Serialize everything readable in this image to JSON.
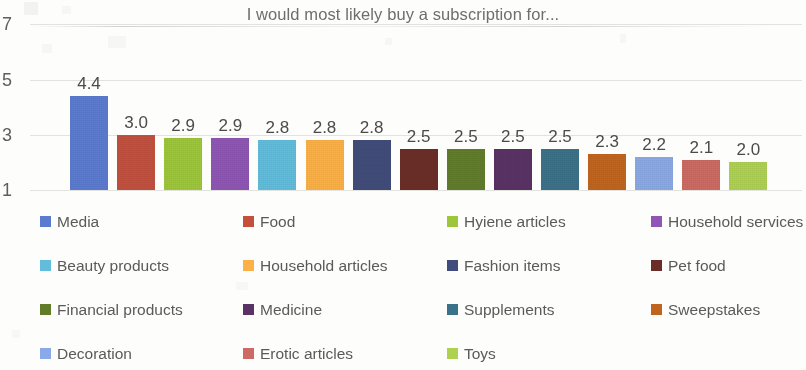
{
  "chart_data": {
    "type": "bar",
    "title": "I would most likely buy a subscription for...",
    "xlabel": "",
    "ylabel": "",
    "ylim": [
      1,
      7
    ],
    "yticks": [
      "1",
      "3",
      "5",
      "7"
    ],
    "grid": true,
    "legend_position": "bottom",
    "legend_columns": 4,
    "categories": [
      "Media",
      "Food",
      "Hyiene articles",
      "Household services",
      "Beauty products",
      "Household articles",
      "Fashion items",
      "Pet food",
      "Financial products",
      "Medicine",
      "Supplements",
      "Sweepstakes",
      "Decoration",
      "Erotic articles",
      "Toys"
    ],
    "values": [
      4.4,
      3.0,
      2.9,
      2.9,
      2.8,
      2.8,
      2.8,
      2.5,
      2.5,
      2.5,
      2.5,
      2.3,
      2.2,
      2.1,
      2.0
    ],
    "value_labels": [
      "4.4",
      "3.0",
      "2.9",
      "2.9",
      "2.8",
      "2.8",
      "2.8",
      "2.5",
      "2.5",
      "2.5",
      "2.5",
      "2.3",
      "2.2",
      "2.1",
      "2.0"
    ],
    "colors": [
      "#5b7bd0",
      "#c4503c",
      "#9ec63b",
      "#9055b5",
      "#62bddd",
      "#fcb147",
      "#424c7c",
      "#6b2d28",
      "#627d2a",
      "#5a3265",
      "#3a728a",
      "#c0651f",
      "#8aa9e8",
      "#cd6a63",
      "#aed24f"
    ]
  },
  "legend": {
    "items": [
      {
        "label": "Media",
        "color": "#5b7bd0"
      },
      {
        "label": "Food",
        "color": "#c4503c"
      },
      {
        "label": "Hyiene articles",
        "color": "#9ec63b"
      },
      {
        "label": "Household services",
        "color": "#9055b5"
      },
      {
        "label": "Beauty products",
        "color": "#62bddd"
      },
      {
        "label": "Household articles",
        "color": "#fcb147"
      },
      {
        "label": "Fashion items",
        "color": "#424c7c"
      },
      {
        "label": "Pet food",
        "color": "#6b2d28"
      },
      {
        "label": "Financial products",
        "color": "#627d2a"
      },
      {
        "label": "Medicine",
        "color": "#5a3265"
      },
      {
        "label": "Supplements",
        "color": "#3a728a"
      },
      {
        "label": "Sweepstakes",
        "color": "#c0651f"
      },
      {
        "label": "Decoration",
        "color": "#8aa9e8"
      },
      {
        "label": "Erotic articles",
        "color": "#cd6a63"
      },
      {
        "label": "Toys",
        "color": "#aed24f"
      }
    ]
  }
}
